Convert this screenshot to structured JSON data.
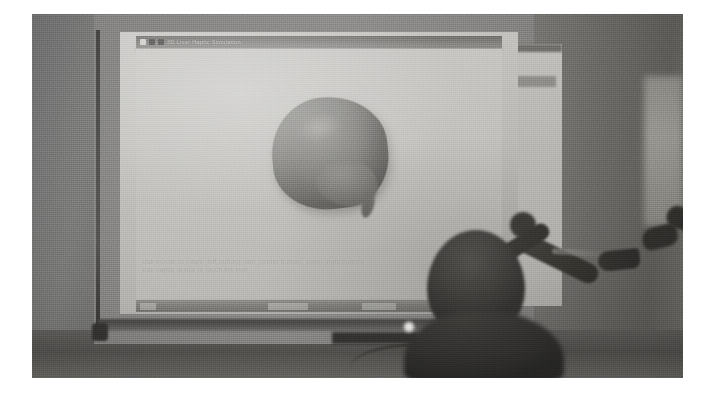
{
  "scene": {
    "description": "Photograph of a dim lecture room: a projected 3D liver-model application shown on a whiteboard while a seated person in the foreground operates a haptic device.",
    "media_type": "photograph"
  },
  "projection": {
    "window": {
      "title": "3D Liver Haptic Simulation",
      "titlebar_icons": [
        "app-icon",
        "document-icon",
        "menu-icon"
      ]
    },
    "model": {
      "label": "liver",
      "render": "3d-organ-mesh"
    },
    "instructions": {
      "line1": "Use mouse to rotate (left button), pan (center button), zoom (right button)",
      "line2": "Use haptic device to touch the liver"
    },
    "taskbar": {
      "buttons": [
        "start-button",
        "task-button-1",
        "task-button-2"
      ]
    }
  },
  "room": {
    "board_label": "whiteboard-projection-surface",
    "side_panel_label": "wall-panel",
    "light_indicator": "led-light"
  },
  "foreground": {
    "person": "seated-viewer-silhouette",
    "arm_near": "operator-arm",
    "arm_far": "second-operator-arm",
    "device": "haptic-stylus"
  },
  "colors": {
    "projection_bg": "#c9c8c4",
    "model": "#7f7e7a",
    "instruction_text": "#a7a6a1",
    "wall": "#6f6e6b",
    "silhouette": "#2d2c2a",
    "led": "#ffffff",
    "page_margin": "#ffffff"
  }
}
